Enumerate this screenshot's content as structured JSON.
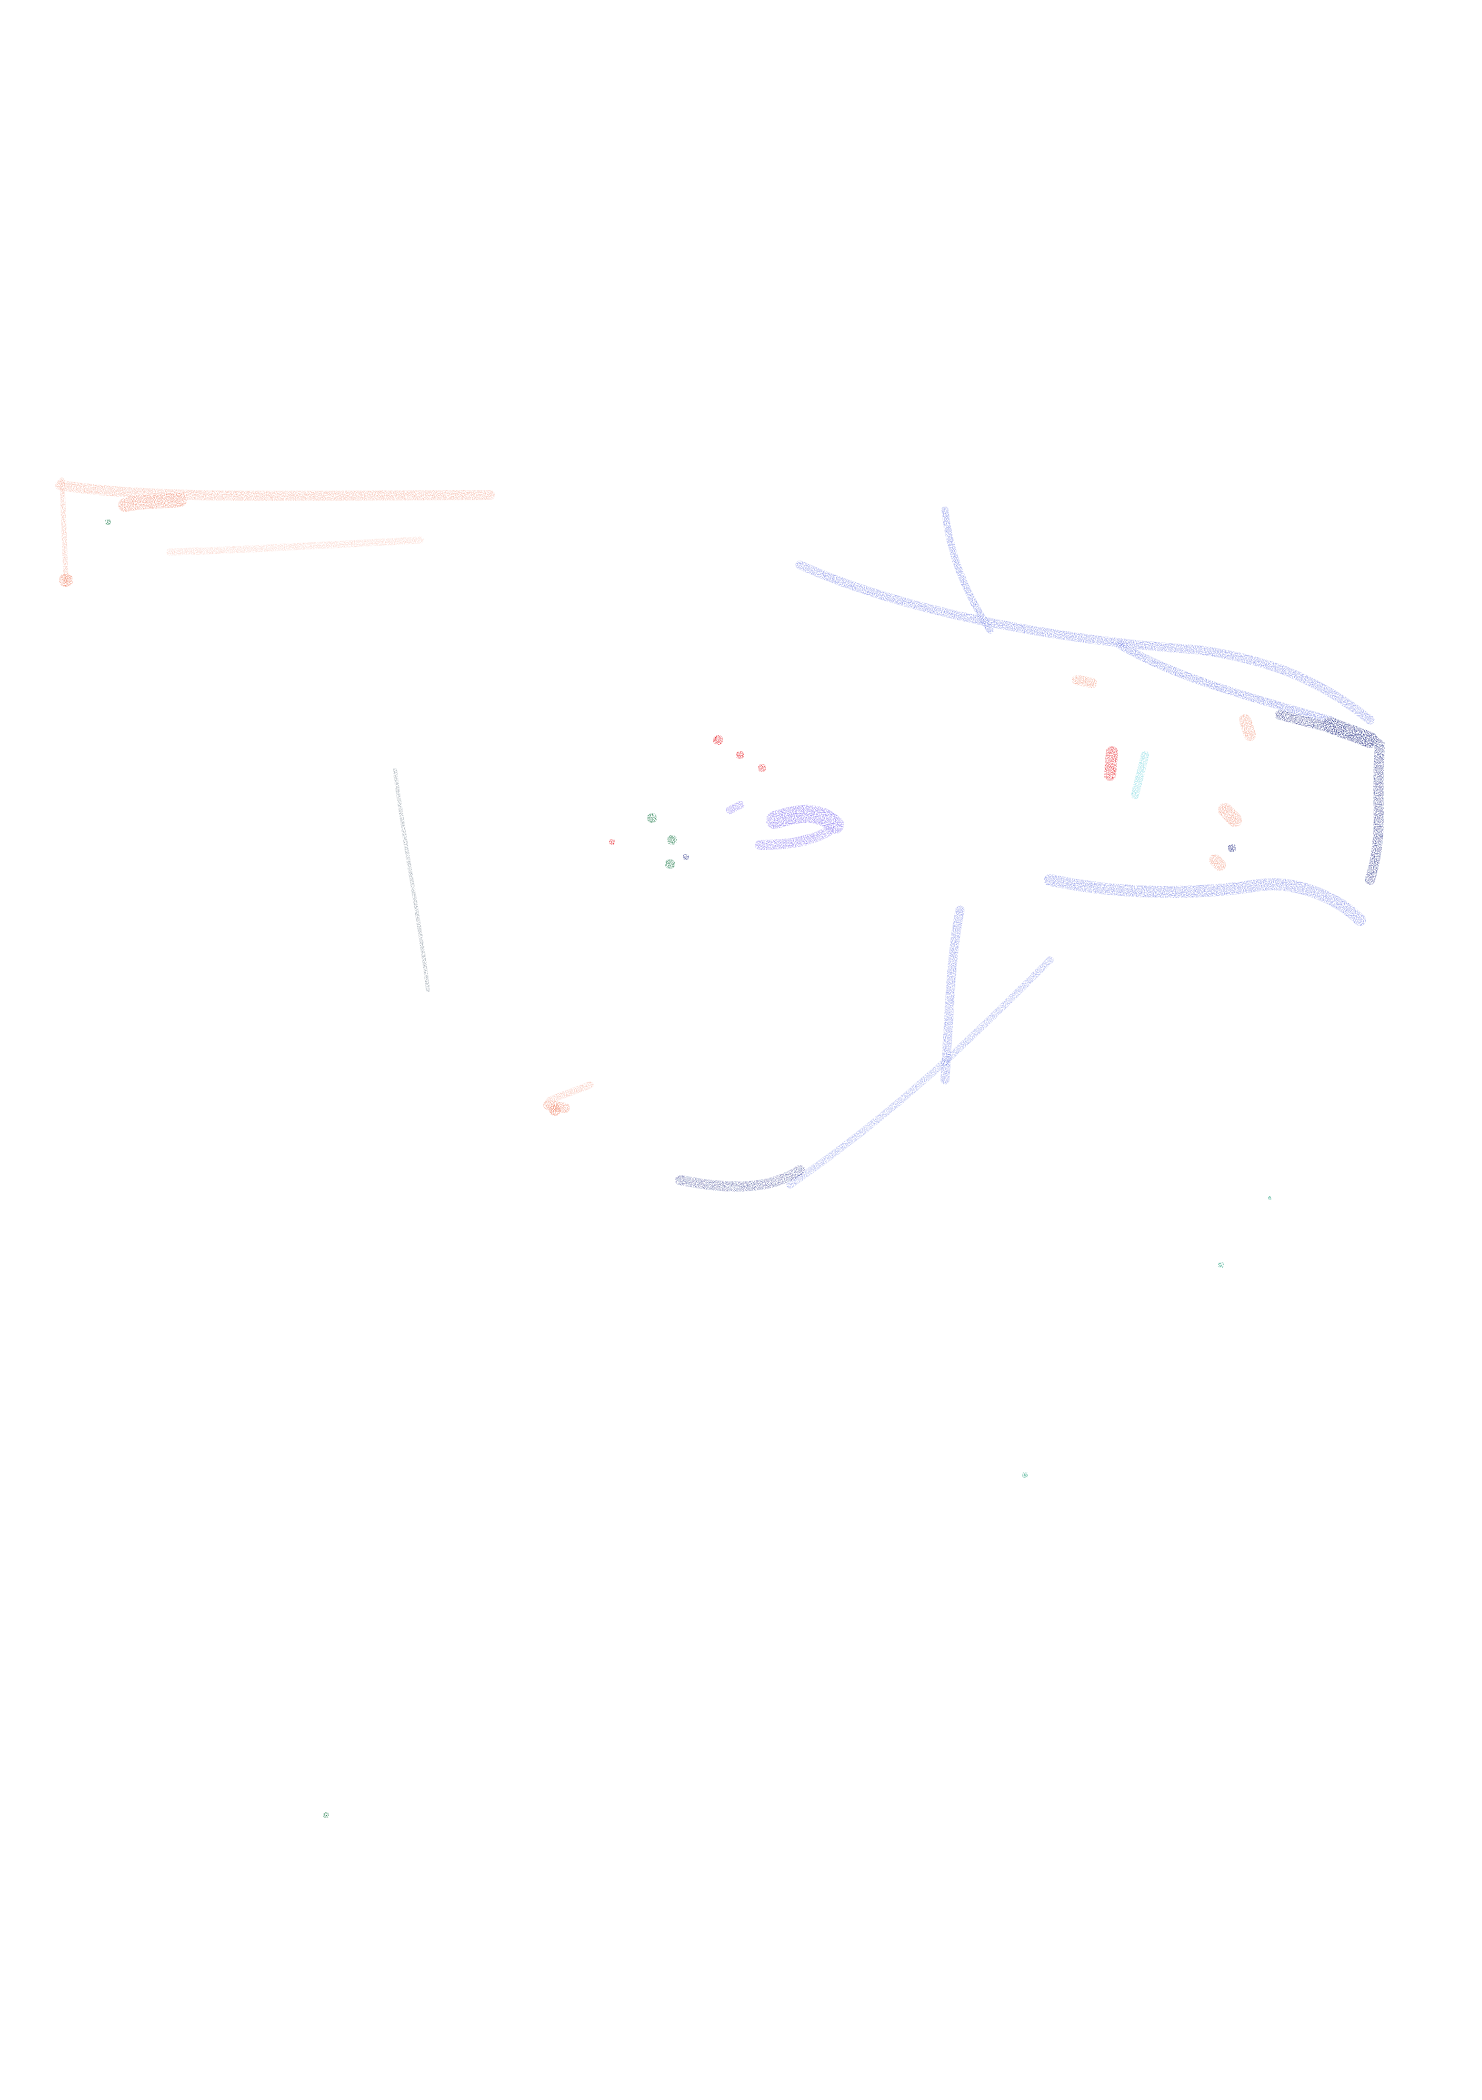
{
  "artwork": {
    "description": "Crayon drawing on white paper of an animal head (horse/dog-like) facing right",
    "background": "#ffffff",
    "colors": {
      "navy": "#1a237e",
      "blue": "#3f51d8",
      "salmon": "#f08a6e",
      "red": "#e8232a",
      "violet": "#7b68ee",
      "green": "#1e7a4a",
      "cyan": "#7fd8e0",
      "teal": "#3aa98a",
      "gray": "#445566"
    },
    "strokes": [
      {
        "name": "top-left-salmon-bar",
        "color": "salmon",
        "width": 10,
        "opacity": 0.55,
        "d": "M60 485 C150 500 300 495 490 495"
      },
      {
        "name": "top-left-salmon-bar-lower",
        "color": "salmon",
        "width": 7,
        "opacity": 0.35,
        "d": "M170 552 C250 550 330 545 420 540"
      },
      {
        "name": "top-left-salmon-dash",
        "color": "salmon",
        "width": 14,
        "opacity": 0.8,
        "d": "M125 505 C145 500 165 502 180 500"
      },
      {
        "name": "top-left-salmon-post",
        "color": "salmon",
        "width": 5,
        "opacity": 0.5,
        "d": "M62 480 L66 580"
      },
      {
        "name": "head-top-outline",
        "color": "blue",
        "width": 9,
        "opacity": 0.55,
        "d": "M800 565 C900 610 1050 640 1200 650 C1270 660 1320 680 1370 720"
      },
      {
        "name": "head-top-outline-2",
        "color": "blue",
        "width": 8,
        "opacity": 0.6,
        "d": "M1120 645 C1180 680 1260 700 1330 720"
      },
      {
        "name": "ear",
        "color": "blue",
        "width": 7,
        "opacity": 0.6,
        "d": "M945 510 C950 560 970 600 990 630"
      },
      {
        "name": "muzzle-front",
        "color": "navy",
        "width": 10,
        "opacity": 0.75,
        "d": "M1280 715 C1340 730 1365 735 1380 745 C1375 800 1385 830 1370 880"
      },
      {
        "name": "jaw",
        "color": "blue",
        "width": 12,
        "opacity": 0.55,
        "d": "M1050 880 C1120 895 1200 895 1260 885 C1300 880 1340 900 1360 920"
      },
      {
        "name": "neck-front",
        "color": "blue",
        "width": 9,
        "opacity": 0.55,
        "d": "M960 910 C950 960 950 1010 945 1080"
      },
      {
        "name": "neck-line",
        "color": "blue",
        "width": 7,
        "opacity": 0.45,
        "d": "M1050 960 C980 1030 900 1110 790 1185"
      },
      {
        "name": "neck-bottom",
        "color": "navy",
        "width": 10,
        "opacity": 0.6,
        "d": "M680 1180 C730 1190 770 1190 800 1170"
      },
      {
        "name": "nose-spot",
        "color": "navy",
        "width": 16,
        "opacity": 0.85,
        "d": "M1330 725 L1370 740"
      },
      {
        "name": "eye-red",
        "color": "red",
        "width": 12,
        "opacity": 0.9,
        "d": "M1112 752 L1110 775"
      },
      {
        "name": "eye-cyan",
        "color": "cyan",
        "width": 8,
        "opacity": 0.85,
        "d": "M1145 755 L1135 795"
      },
      {
        "name": "cheek-salmon",
        "color": "salmon",
        "width": 14,
        "opacity": 0.75,
        "d": "M1225 810 L1235 820"
      },
      {
        "name": "cheek-salmon-2",
        "color": "salmon",
        "width": 12,
        "opacity": 0.7,
        "d": "M1215 860 L1220 865"
      },
      {
        "name": "brow-salmon",
        "color": "salmon",
        "width": 12,
        "opacity": 0.7,
        "d": "M1245 720 L1250 735"
      },
      {
        "name": "mane-salmon",
        "color": "salmon",
        "width": 10,
        "opacity": 0.7,
        "d": "M1077 680 L1092 683"
      },
      {
        "name": "violet-blob",
        "color": "violet",
        "width": 18,
        "opacity": 0.85,
        "d": "M775 820 C800 812 820 810 835 825"
      },
      {
        "name": "violet-blob-2",
        "color": "violet",
        "width": 10,
        "opacity": 0.75,
        "d": "M760 845 C790 845 815 840 830 830"
      },
      {
        "name": "violet-dash",
        "color": "violet",
        "width": 8,
        "opacity": 0.7,
        "d": "M730 810 L740 805"
      },
      {
        "name": "back-line",
        "color": "gray",
        "width": 4,
        "opacity": 0.5,
        "d": "M395 770 C405 850 420 920 428 990"
      },
      {
        "name": "salmon-body-1",
        "color": "salmon",
        "width": 7,
        "opacity": 0.5,
        "d": "M550 1100 L590 1085"
      },
      {
        "name": "salmon-body-2",
        "color": "salmon",
        "width": 10,
        "opacity": 0.75,
        "d": "M548 1105 L565 1108"
      }
    ],
    "dots": [
      {
        "color": "green",
        "x": 652,
        "y": 818,
        "r": 5
      },
      {
        "color": "green",
        "x": 672,
        "y": 840,
        "r": 5
      },
      {
        "color": "green",
        "x": 670,
        "y": 864,
        "r": 5
      },
      {
        "color": "green",
        "x": 108,
        "y": 522,
        "r": 3
      },
      {
        "color": "green",
        "x": 326,
        "y": 1815,
        "r": 3
      },
      {
        "color": "red",
        "x": 718,
        "y": 740,
        "r": 5
      },
      {
        "color": "red",
        "x": 740,
        "y": 755,
        "r": 4
      },
      {
        "color": "red",
        "x": 762,
        "y": 768,
        "r": 4
      },
      {
        "color": "red",
        "x": 612,
        "y": 842,
        "r": 3
      },
      {
        "color": "navy",
        "x": 686,
        "y": 857,
        "r": 3
      },
      {
        "color": "navy",
        "x": 1232,
        "y": 848,
        "r": 4
      },
      {
        "color": "teal",
        "x": 1221,
        "y": 1265,
        "r": 3
      },
      {
        "color": "teal",
        "x": 1025,
        "y": 1475,
        "r": 3
      },
      {
        "color": "teal",
        "x": 1270,
        "y": 1198,
        "r": 2
      },
      {
        "color": "salmon",
        "x": 555,
        "y": 1110,
        "r": 6
      },
      {
        "color": "salmon",
        "x": 66,
        "y": 580,
        "r": 7
      }
    ]
  }
}
